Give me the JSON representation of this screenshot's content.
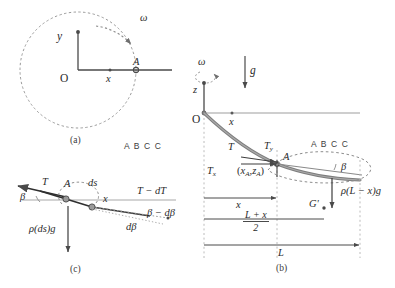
{
  "figure": {
    "stroke_color": "#4a4a4a",
    "cable_color": "#5f5f5f",
    "dash_color": "#8a8a8a"
  },
  "panel_a": {
    "caption": "(a)",
    "omega_label": "ω",
    "y_axis_label": "y",
    "x_axis_label": "x",
    "origin_label": "O",
    "point_label": "A"
  },
  "panel_b": {
    "caption": "(b)",
    "omega_label": "ω",
    "gravity_label": "g",
    "z_axis_label": "z",
    "x_axis_label": "x",
    "origin_label": "O",
    "point_label": "A",
    "tension_label": "T",
    "tension_x_label": "T",
    "tension_x_sub": "x",
    "tension_y_label": "T",
    "tension_y_sub": "y",
    "coord_label_open": "(",
    "coord_x": "x",
    "coord_x_sub": "A",
    "coord_comma": ",",
    "coord_z": "z",
    "coord_z_sub": "A",
    "coord_label_close": ")",
    "beta_label": "β",
    "abcc_label": "A B C C",
    "weight_label": "ρ(L − x)g",
    "centroid_label": "G'",
    "dim_x": "x",
    "dim_mid_num": "L + x",
    "dim_mid_den": "2",
    "dim_L": "L"
  },
  "panel_c": {
    "caption": "(c)",
    "tension_label": "T",
    "point_label": "A",
    "ds_label": "ds",
    "x_label": "x",
    "beta_label": "β",
    "tension_out_label": "T − dT",
    "beta_out_label": "β − dβ",
    "dbeta_label": "dβ",
    "weight_label": "ρ(ds)g"
  },
  "middle": {
    "abcc_label": "A B C C"
  }
}
